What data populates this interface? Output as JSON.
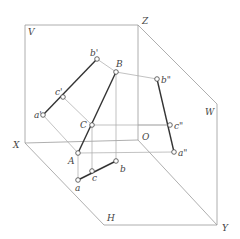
{
  "diagram": {
    "planes": {
      "V": {
        "label": "V",
        "x": 28,
        "y": 35
      },
      "W": {
        "label": "W",
        "x": 205,
        "y": 115
      },
      "H": {
        "label": "H",
        "x": 107,
        "y": 221
      }
    },
    "axes": {
      "X": {
        "label": "X",
        "x": 13,
        "y": 148
      },
      "Y": {
        "label": "Y",
        "x": 222,
        "y": 231
      },
      "Z": {
        "label": "Z",
        "x": 142,
        "y": 24
      },
      "O": {
        "label": "O",
        "x": 142,
        "y": 140
      }
    },
    "points": {
      "A": {
        "label": "A",
        "x": 78,
        "y": 153,
        "lx": 68,
        "ly": 164
      },
      "B": {
        "label": "B",
        "x": 116,
        "y": 72,
        "lx": 116,
        "ly": 67
      },
      "C": {
        "label": "C",
        "x": 92,
        "y": 125,
        "lx": 80,
        "ly": 128
      },
      "a_v": {
        "label": "a'",
        "x": 43,
        "y": 115,
        "lx": 34,
        "ly": 118
      },
      "b_v": {
        "label": "b'",
        "x": 97,
        "y": 59,
        "lx": 90,
        "ly": 56
      },
      "c_v": {
        "label": "c'",
        "x": 63,
        "y": 97,
        "lx": 55,
        "ly": 95
      },
      "a_h": {
        "label": "a",
        "x": 78,
        "y": 180,
        "lx": 75,
        "ly": 191
      },
      "b_h": {
        "label": "b",
        "x": 116,
        "y": 161,
        "lx": 120,
        "ly": 172
      },
      "c_h": {
        "label": "c",
        "x": 92,
        "y": 171,
        "lx": 92,
        "ly": 181
      },
      "a_w": {
        "label": "a\"",
        "x": 174,
        "y": 152,
        "lx": 178,
        "ly": 156
      },
      "b_w": {
        "label": "b\"",
        "x": 157,
        "y": 79,
        "lx": 161,
        "ly": 83
      },
      "c_w": {
        "label": "c\"",
        "x": 170,
        "y": 125,
        "lx": 174,
        "ly": 129
      }
    }
  }
}
